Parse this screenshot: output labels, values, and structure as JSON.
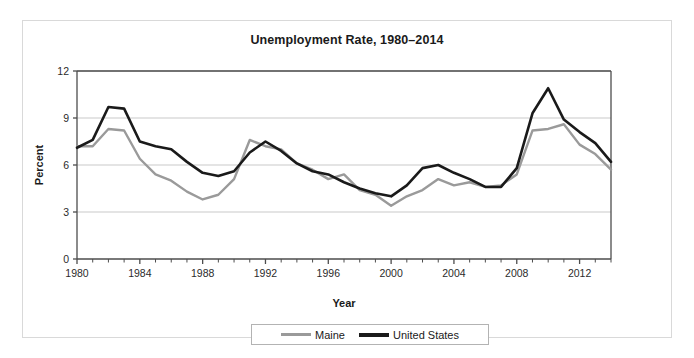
{
  "figure": {
    "title": "Unemployment Rate, 1980–2014"
  },
  "legend": {
    "items": [
      {
        "label": "Maine",
        "color": "#9a9a9a",
        "swatch": "maine"
      },
      {
        "label": "United States",
        "color": "#1a1a1a",
        "swatch": "us"
      }
    ]
  },
  "chart_data": {
    "type": "line",
    "title": "Unemployment Rate, 1980–2014",
    "xlabel": "Year",
    "ylabel": "Percent",
    "xlim": [
      1980,
      2014
    ],
    "ylim": [
      0,
      12
    ],
    "yticks": [
      0,
      3,
      6,
      9,
      12
    ],
    "xticks": [
      1980,
      1984,
      1988,
      1992,
      1996,
      2000,
      2004,
      2008,
      2012
    ],
    "xtick_labels": [
      "1980",
      "1984",
      "1988",
      "1992",
      "1996",
      "2000",
      "2004",
      "2008",
      "2012"
    ],
    "ytick_labels": [
      "0",
      "3",
      "6",
      "9",
      "12"
    ],
    "minor_xticks_every": 1,
    "grid": "horizontal",
    "legend_position": "bottom-outside",
    "x": [
      1980,
      1981,
      1982,
      1983,
      1984,
      1985,
      1986,
      1987,
      1988,
      1989,
      1990,
      1991,
      1992,
      1993,
      1994,
      1995,
      1996,
      1997,
      1998,
      1999,
      2000,
      2001,
      2002,
      2003,
      2004,
      2005,
      2006,
      2007,
      2008,
      2009,
      2010,
      2011,
      2012,
      2013,
      2014
    ],
    "series": [
      {
        "name": "Maine",
        "color": "#9a9a9a",
        "values": [
          7.2,
          7.2,
          8.3,
          8.2,
          6.4,
          5.4,
          5.0,
          4.3,
          3.8,
          4.1,
          5.1,
          7.6,
          7.2,
          7.0,
          6.1,
          5.7,
          5.1,
          5.4,
          4.4,
          4.1,
          3.4,
          4.0,
          4.4,
          5.1,
          4.7,
          4.9,
          4.6,
          4.7,
          5.4,
          8.2,
          8.3,
          8.6,
          7.3,
          6.7,
          5.7
        ]
      },
      {
        "name": "United States",
        "color": "#1a1a1a",
        "values": [
          7.1,
          7.6,
          9.7,
          9.6,
          7.5,
          7.2,
          7.0,
          6.2,
          5.5,
          5.3,
          5.6,
          6.8,
          7.5,
          6.9,
          6.1,
          5.6,
          5.4,
          4.9,
          4.5,
          4.2,
          4.0,
          4.7,
          5.8,
          6.0,
          5.5,
          5.1,
          4.6,
          4.6,
          5.8,
          9.3,
          10.9,
          8.9,
          8.1,
          7.4,
          6.2
        ]
      }
    ]
  }
}
